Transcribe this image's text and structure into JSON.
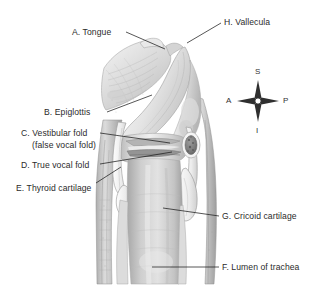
{
  "figure": {
    "background_color": "#ffffff",
    "label_color": "#2b2b2b",
    "leader_color": "#1d1d1d"
  },
  "labels": [
    {
      "key": "A",
      "text": "A. Tongue",
      "x": 72,
      "y": 27
    },
    {
      "key": "H",
      "text": "H. Vallecula",
      "x": 224,
      "y": 17
    },
    {
      "key": "B",
      "text": "B. Epiglottis",
      "x": 44,
      "y": 107
    },
    {
      "key": "C",
      "text": "C. Vestibular fold",
      "x": 21,
      "y": 128
    },
    {
      "key": "C2",
      "text": "(false vocal fold)",
      "x": 32,
      "y": 140
    },
    {
      "key": "D",
      "text": "D. True vocal fold",
      "x": 21,
      "y": 160
    },
    {
      "key": "E",
      "text": "E. Thyroid cartilage",
      "x": 16,
      "y": 183
    },
    {
      "key": "G",
      "text": "G. Cricoid cartilage",
      "x": 222,
      "y": 211
    },
    {
      "key": "F",
      "text": "F. Lumen of trachea",
      "x": 222,
      "y": 262
    }
  ],
  "compass": {
    "name": "anatomical-orientation-compass",
    "center_x": 258,
    "center_y": 101,
    "superior": "S",
    "inferior": "I",
    "anterior": "A",
    "posterior": "P"
  },
  "leader_lines": [
    {
      "key": "A",
      "x1": 126,
      "y1": 32,
      "x2": 165,
      "y2": 49
    },
    {
      "key": "H",
      "x1": 221,
      "y1": 23,
      "x2": 187,
      "y2": 43
    },
    {
      "key": "B",
      "x1": 107,
      "y1": 112,
      "x2": 152,
      "y2": 95
    },
    {
      "key": "C",
      "x1": 100,
      "y1": 133,
      "x2": 170,
      "y2": 143
    },
    {
      "key": "D",
      "x1": 100,
      "y1": 164,
      "x2": 172,
      "y2": 152
    },
    {
      "key": "E",
      "x1": 96,
      "y1": 183,
      "x2": 121,
      "y2": 167
    },
    {
      "key": "G",
      "x1": 219,
      "y1": 216,
      "x2": 163,
      "y2": 208
    },
    {
      "key": "F",
      "x1": 219,
      "y1": 267,
      "x2": 152,
      "y2": 267
    }
  ],
  "anatomy_regions": [
    {
      "name": "tongue",
      "label_key": "A"
    },
    {
      "name": "vallecula",
      "label_key": "H"
    },
    {
      "name": "epiglottis",
      "label_key": "B"
    },
    {
      "name": "vestibular-fold",
      "label_key": "C"
    },
    {
      "name": "true-vocal-fold",
      "label_key": "D"
    },
    {
      "name": "thyroid-cartilage",
      "label_key": "E"
    },
    {
      "name": "cricoid-cartilage",
      "label_key": "G"
    },
    {
      "name": "trachea-lumen",
      "label_key": "F"
    }
  ]
}
